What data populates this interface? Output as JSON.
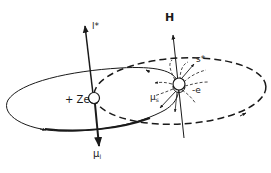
{
  "diagram": {
    "labels": {
      "field": "H",
      "orbital_angular_momentum": "l*",
      "nucleus_charge": "+ Ze",
      "orbital_magnetic_moment_symbol": "μ",
      "orbital_magnetic_moment_subscript": "l",
      "spin": "s*",
      "electron_charge": "-e",
      "spin_magnetic_moment_symbol": "μ",
      "spin_magnetic_moment_subscript": "s"
    },
    "elements": [
      {
        "name": "solid-orbit",
        "style": "solid",
        "description": "Electron orbit around nucleus"
      },
      {
        "name": "dashed-orbit",
        "style": "dashed",
        "description": "Apparent nucleus orbit in electron frame"
      },
      {
        "name": "nucleus",
        "description": "Sphere at center of solid orbit"
      },
      {
        "name": "electron",
        "description": "Spinning sphere with field lines"
      },
      {
        "name": "l-axis",
        "direction": "up",
        "label": "l*"
      },
      {
        "name": "mu-l-axis",
        "direction": "down",
        "label": "μl"
      },
      {
        "name": "H-axis",
        "direction": "up",
        "label": "H"
      }
    ],
    "colors": {
      "ink": "#1a1a1a",
      "background": "#ffffff"
    }
  }
}
